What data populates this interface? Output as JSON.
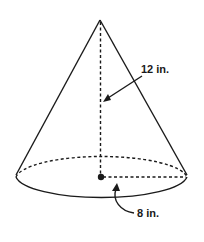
{
  "diagram": {
    "type": "cone",
    "title": "",
    "labels": {
      "height": "12 in.",
      "radius": "8 in."
    },
    "measurements": {
      "height": {
        "value": 12,
        "unit": "in."
      },
      "radius": {
        "value": 8,
        "unit": "in."
      }
    },
    "colors": {
      "stroke": "#1a1a1a",
      "background": "#ffffff"
    }
  }
}
